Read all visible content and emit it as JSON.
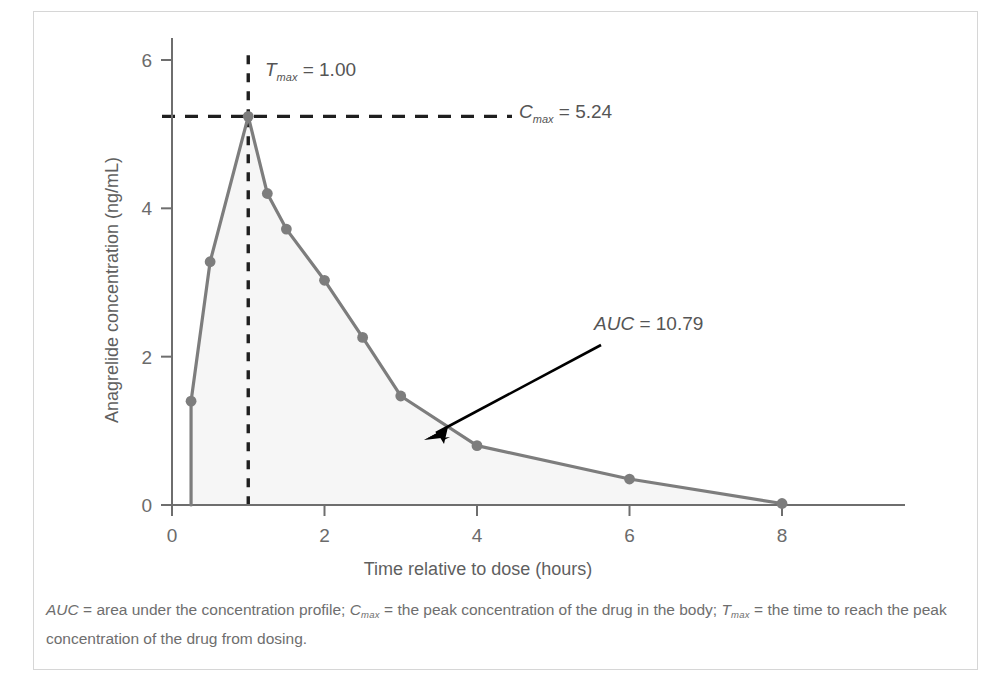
{
  "figure": {
    "y_axis_label": "Anagrelide concentration (ng/mL)",
    "x_axis_label": "Time relative to dose (hours)",
    "annotations": {
      "tmax_symbol": "T",
      "tmax_sub": "max",
      "tmax_value": " = 1.00",
      "cmax_symbol": "C",
      "cmax_sub": "max",
      "cmax_value": " = 5.24",
      "auc_symbol": "AUC",
      "auc_value": " = 10.79"
    },
    "caption": {
      "seg1_abbr": "AUC",
      "seg1_text": " = area under the concentration profile; ",
      "seg2_abbr": "C",
      "seg2_sub": "max",
      "seg2_text": " = the peak concentration of the drug in the body; ",
      "seg3_abbr": "T",
      "seg3_sub": "max",
      "seg3_text": " = the time to reach the peak concentration of the drug from dosing."
    },
    "colors": {
      "curve": "#7d7d7d",
      "marker": "#7d7d7d",
      "fill": "#f6f6f6",
      "dashed": "#1f1f1f",
      "arrow": "#000000",
      "axis": "#6e6e6e",
      "frame": "#d6d6d6"
    }
  },
  "chart_data": {
    "type": "line",
    "title": "",
    "xlabel": "Time relative to dose (hours)",
    "ylabel": "Anagrelide concentration (ng/mL)",
    "xlim": [
      0,
      8.6
    ],
    "ylim": [
      0,
      6.3
    ],
    "xticks": [
      0,
      2,
      4,
      6,
      8
    ],
    "yticks": [
      0,
      2,
      4,
      6
    ],
    "xtick_labels": [
      "0",
      "2",
      "4",
      "6",
      "8"
    ],
    "ytick_labels": [
      "0",
      "2",
      "4",
      "6"
    ],
    "grid": false,
    "legend": false,
    "area_filled": true,
    "x": [
      0.25,
      0.25,
      0.5,
      1.0,
      1.25,
      1.5,
      2.0,
      2.5,
      3.0,
      4.0,
      6.0,
      8.0
    ],
    "y": [
      0.0,
      1.4,
      3.28,
      5.24,
      4.2,
      3.72,
      3.03,
      2.26,
      1.47,
      0.8,
      0.35,
      0.02
    ],
    "markers_x": [
      0.25,
      0.5,
      1.0,
      1.25,
      1.5,
      2.0,
      2.5,
      3.0,
      4.0,
      6.0,
      8.0
    ],
    "markers_y": [
      1.4,
      3.28,
      5.24,
      4.2,
      3.72,
      3.03,
      2.26,
      1.47,
      0.8,
      0.35,
      0.02
    ],
    "tmax": 1.0,
    "cmax": 5.24,
    "auc": 10.79,
    "series": [
      {
        "name": "Anagrelide concentration",
        "x": [
          0.25,
          0.25,
          0.5,
          1.0,
          1.25,
          1.5,
          2.0,
          2.5,
          3.0,
          4.0,
          6.0,
          8.0
        ],
        "values": [
          0.0,
          1.4,
          3.28,
          5.24,
          4.2,
          3.72,
          3.03,
          2.26,
          1.47,
          0.8,
          0.35,
          0.02
        ]
      }
    ]
  }
}
